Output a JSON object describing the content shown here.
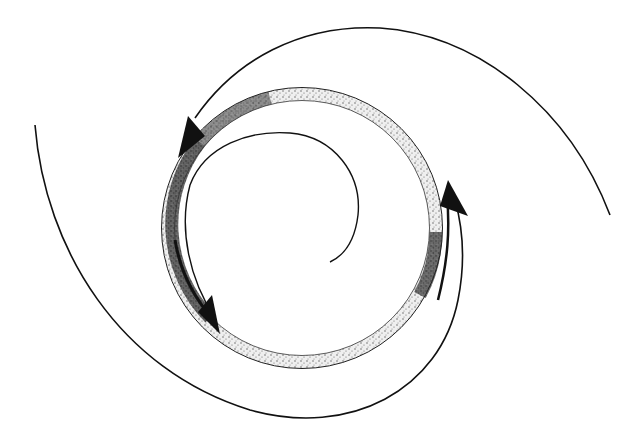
{
  "figure": {
    "colors": {
      "background": "#ffffff",
      "stroke": "#111111",
      "stipple_light": "#d9d9d9",
      "stipple_dark": "#3a3a3a"
    },
    "ring": {
      "cx": 302,
      "cy": 228,
      "r": 134,
      "thickness": 12
    },
    "arrows": [
      {
        "name": "upper-left-arrow",
        "position": "upper left of ring",
        "direction": "down-left"
      },
      {
        "name": "lower-left-arrow",
        "position": "lower left of ring",
        "direction": "down-right"
      },
      {
        "name": "right-arrow",
        "position": "right side of ring",
        "direction": "up"
      }
    ],
    "spiral_arms": [
      {
        "name": "outer-arm-top",
        "from": "far right (610,215)",
        "to": "ring upper-left arrow"
      },
      {
        "name": "outer-arm-bottom",
        "from": "far left (35,125)",
        "to": "ring right arrow via bottom"
      },
      {
        "name": "inner-arm",
        "from": "ring left interior",
        "to": "center (330,262)"
      }
    ]
  }
}
